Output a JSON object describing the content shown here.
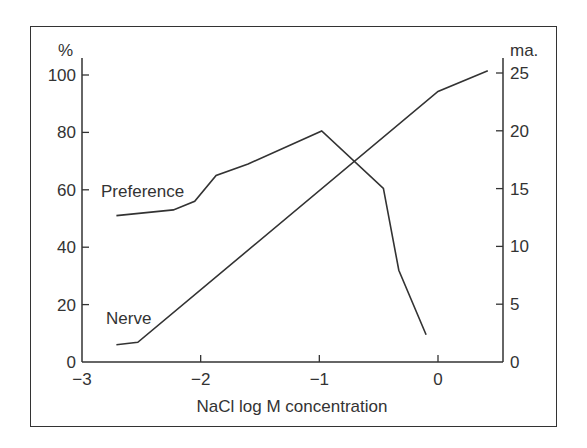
{
  "chart_data": {
    "type": "line",
    "title": "",
    "xlabel": "NaCl log M concentration",
    "ylabel_left": "%",
    "ylabel_right": "ma.",
    "xlim": [
      -3,
      0.45
    ],
    "ylim_left": [
      0,
      100
    ],
    "ylim_right": [
      0,
      25
    ],
    "x_ticks": [
      -3,
      -2,
      -1,
      0
    ],
    "x_tick_labels": [
      "−3",
      "−2",
      "−1",
      "0"
    ],
    "y_left_ticks": [
      0,
      20,
      40,
      60,
      80,
      100
    ],
    "y_left_tick_labels": [
      "0",
      "20",
      "40",
      "60",
      "80",
      "100"
    ],
    "y_right_ticks": [
      0,
      5,
      10,
      15,
      20,
      25
    ],
    "y_right_tick_labels": [
      "0",
      "5",
      "10",
      "15",
      "20",
      "25"
    ],
    "grid": false,
    "legend": "inline labels",
    "series": [
      {
        "name": "Preference",
        "axis": "left",
        "unit": "%",
        "x": [
          -2.71,
          -2.23,
          -2.05,
          -1.87,
          -1.6,
          -0.98,
          -0.46,
          -0.33,
          -0.1
        ],
        "values": [
          51,
          53,
          56,
          65,
          69,
          80.5,
          60.5,
          32,
          9.5
        ]
      },
      {
        "name": "Nerve",
        "axis": "right",
        "unit": "ma.",
        "x": [
          -2.71,
          -2.53,
          0.0,
          0.42
        ],
        "values": [
          1.5,
          1.7,
          23.4,
          25.2
        ]
      }
    ]
  },
  "labels": {
    "left_unit": "%",
    "right_unit": "ma.",
    "xlabel": "NaCl log M concentration",
    "preference": "Preference",
    "nerve": "Nerve",
    "x_ticks": [
      "−3",
      "−2",
      "−1",
      "0"
    ],
    "y_left": [
      "0",
      "20",
      "40",
      "60",
      "80",
      "100"
    ],
    "y_right": [
      "0",
      "5",
      "10",
      "15",
      "20",
      "25"
    ]
  }
}
